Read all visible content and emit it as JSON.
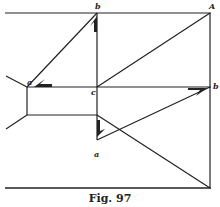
{
  "figure": {
    "caption": "Fig. 97",
    "ink_color": "#222222",
    "background": "#ffffff",
    "labels": {
      "top_b": "b",
      "top_right_A": "A",
      "left_a": "a",
      "center_c": "c",
      "right_b": "b",
      "lower_a": "a"
    }
  }
}
